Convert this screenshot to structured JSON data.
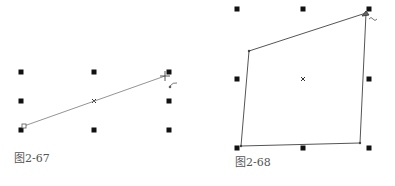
{
  "figures": [
    {
      "caption": "图2-67",
      "description": "Straight line being skewed/rotated with corner handle; 8 selection handles and center marker",
      "handles": [
        [
          21,
          72
        ],
        [
          94,
          72
        ],
        [
          169,
          72
        ],
        [
          21,
          101
        ],
        [
          169,
          101
        ],
        [
          21,
          130
        ],
        [
          94,
          130
        ],
        [
          169,
          130
        ]
      ],
      "center": [
        94,
        101
      ],
      "line": {
        "from": [
          24,
          126
        ],
        "to": [
          165,
          76
        ]
      },
      "start_node": [
        24,
        126
      ],
      "cursor": [
        165,
        76
      ],
      "rotate_cursor": [
        172,
        85
      ]
    },
    {
      "caption": "图2-68",
      "description": "Quadrilateral being distorted with corner handle; 8 selection handles and center marker",
      "handles": [
        [
          237,
          9
        ],
        [
          303,
          9
        ],
        [
          369,
          9
        ],
        [
          237,
          79
        ],
        [
          369,
          79
        ],
        [
          237,
          148
        ],
        [
          303,
          148
        ],
        [
          369,
          148
        ]
      ],
      "center": [
        303,
        79
      ],
      "polygon": [
        [
          249,
          51
        ],
        [
          366,
          13
        ],
        [
          360,
          143
        ],
        [
          241,
          146
        ]
      ],
      "cursor": [
        366,
        13
      ],
      "tilde_cursor": [
        371,
        19
      ]
    }
  ],
  "colors": {
    "handle": "#111111",
    "line": "#777777",
    "polygon": "#555555",
    "caption": "#555555"
  }
}
